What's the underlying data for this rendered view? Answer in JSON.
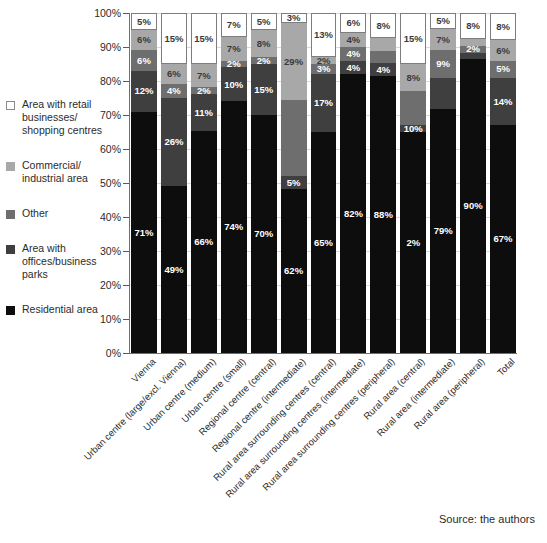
{
  "chart_data": {
    "type": "bar",
    "stacked": true,
    "title": "",
    "xlabel": "",
    "ylabel": "",
    "ylim": [
      0,
      100
    ],
    "unit": "%",
    "grid": true,
    "legend_position": "left",
    "ytick_labels": [
      "100%",
      "90%",
      "80%",
      "70%",
      "60%",
      "50%",
      "40%",
      "30%",
      "20%",
      "10%",
      "0%"
    ],
    "ytick_values": [
      100,
      90,
      80,
      70,
      60,
      50,
      40,
      30,
      20,
      10,
      0
    ],
    "categories": [
      "Vienna",
      "Urban centre (large/excl. Vienna)",
      "Urban centre (medium)",
      "Urban centre (small)",
      "Regional centre (central)",
      "Regional centre (intermediate)",
      "Rural area surrounding centres (central)",
      "Rural area surrounding centres (intermediate)",
      "Rural area surrounding centres (peripheral)",
      "Rural area (central)",
      "Rural area (intermediate)",
      "Rural area (peripheral)",
      "Total"
    ],
    "series": [
      {
        "name": "Residential area",
        "color": "#0d0d0d",
        "values": [
          71,
          49,
          66,
          74,
          70,
          62,
          65,
          82,
          88,
          65,
          79,
          90,
          67
        ]
      },
      {
        "name": "Area with offices/business parks",
        "color": "#3f3f3f",
        "values": [
          12,
          26,
          11,
          10,
          15,
          5,
          17,
          4,
          4,
          2,
          10,
          2,
          14
        ]
      },
      {
        "name": "Other",
        "color": "#6e6e6e",
        "values": [
          6,
          4,
          2,
          2,
          2,
          29,
          3,
          4,
          4,
          10,
          9,
          2,
          5
        ]
      },
      {
        "name": "Commercial/industrial area",
        "color": "#a8a8a8",
        "values": [
          6,
          6,
          7,
          7,
          8,
          29,
          2,
          4,
          4,
          8,
          7,
          2,
          6
        ]
      },
      {
        "name": "Area with retail businesses/shopping centres",
        "color": "#ffffff",
        "values": [
          5,
          15,
          15,
          7,
          5,
          3,
          13,
          6,
          8,
          15,
          5,
          8,
          8
        ]
      }
    ],
    "segment_labels": [
      {
        "category": "Vienna",
        "retail": "5%",
        "commercial": "6%",
        "other": "6%",
        "offices": "12%",
        "residential": "71%"
      },
      {
        "category": "Urban centre (large/excl. Vienna)",
        "retail": "15%",
        "commercial": "6%",
        "other": "4%",
        "offices": "26%",
        "residential": "49%"
      },
      {
        "category": "Urban centre (medium)",
        "retail": "15%",
        "commercial": "7%",
        "other": "2%",
        "offices": "11%",
        "residential": "66%"
      },
      {
        "category": "Urban centre (small)",
        "retail": "7%",
        "commercial": "7%",
        "other": "2%",
        "offices": "10%",
        "residential": "74%"
      },
      {
        "category": "Regional centre (central)",
        "retail": "5%",
        "commercial": "8%",
        "other": "2%",
        "offices": "15%",
        "residential": "70%"
      },
      {
        "category": "Regional centre (intermediate)",
        "retail": "3%",
        "commercial": "29%",
        "other": "",
        "offices": "5%",
        "residential": "62%"
      },
      {
        "category": "Rural area surrounding centres (central)",
        "retail": "13%",
        "commercial": "2%",
        "other": "3%",
        "offices": "17%",
        "residential": "65%"
      },
      {
        "category": "Rural area surrounding centres (intermediate)",
        "retail": "6%",
        "commercial": "4%",
        "other": "4%",
        "offices": "4%",
        "residential": "82%"
      },
      {
        "category": "Rural area surrounding centres (peripheral)",
        "retail": "8%",
        "commercial": "",
        "other": "",
        "offices": "4%",
        "residential": "88%"
      },
      {
        "category": "Rural area (central)",
        "retail": "15%",
        "commercial": "8%",
        "other": "",
        "offices": "10%",
        "residential": "2%"
      },
      {
        "category": "Rural area (intermediate)",
        "retail": "5%",
        "commercial": "7%",
        "other": "9%",
        "offices": "",
        "residential": "79%"
      },
      {
        "category": "Rural area (peripheral)",
        "retail": "8%",
        "commercial": "",
        "other": "2%",
        "offices": "",
        "residential": "90%"
      },
      {
        "category": "Total",
        "retail": "8%",
        "commercial": "6%",
        "other": "5%",
        "offices": "14%",
        "residential": "67%"
      }
    ]
  },
  "legend": {
    "items": [
      {
        "label": "Area with retail businesses/\nshopping centres",
        "color": "#ffffff",
        "name": "retail"
      },
      {
        "label": "Commercial/\nindustrial area",
        "color": "#a8a8a8",
        "name": "commercial"
      },
      {
        "label": "Other",
        "color": "#6e6e6e",
        "name": "other"
      },
      {
        "label": "Area with\noffices/business\nparks",
        "color": "#3f3f3f",
        "name": "offices"
      },
      {
        "label": "Residential area",
        "color": "#0d0d0d",
        "name": "residential"
      }
    ]
  },
  "source": {
    "text": "Source: the authors"
  }
}
